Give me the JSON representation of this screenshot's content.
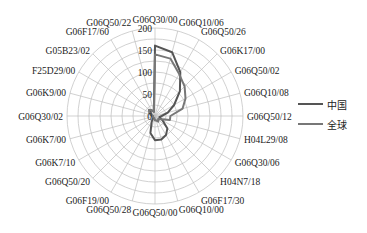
{
  "chart_data": {
    "type": "radar",
    "title": "",
    "categories": [
      "G06Q30/00",
      "G06Q10/06",
      "G06Q50/26",
      "G06K17/00",
      "G06Q50/02",
      "G06Q10/08",
      "G06Q50/12",
      "H04L29/08",
      "G06Q30/06",
      "H04N7/18",
      "G06F17/30",
      "G06Q10/00",
      "G06Q50/00",
      "G06Q50/28",
      "G06F19/00",
      "G06Q50/20",
      "G06K7/10",
      "G06K7/00",
      "G06Q30/02",
      "G06K9/00",
      "F25D29/00",
      "G05B23/02",
      "G06F17/60",
      "G06Q50/22"
    ],
    "radial_ticks": [
      0,
      50,
      100,
      150,
      200
    ],
    "radial_tick_labels": [
      "0",
      "50",
      "100",
      "150",
      "200"
    ],
    "rlim": [
      0,
      200
    ],
    "grid": true,
    "legend_position": "right",
    "series": [
      {
        "name": "中国",
        "color": "#555555",
        "values": [
          160,
          150,
          115,
          80,
          50,
          30,
          15,
          10,
          20,
          40,
          50,
          55,
          55,
          40,
          15,
          5,
          5,
          5,
          5,
          8,
          10,
          15,
          15,
          10
        ]
      },
      {
        "name": "全球",
        "color": "#777777",
        "values": [
          140,
          135,
          110,
          95,
          80,
          65,
          35,
          35,
          15,
          10,
          15,
          10,
          10,
          5,
          5,
          5,
          5,
          5,
          5,
          10,
          15,
          20,
          15,
          10
        ]
      }
    ]
  },
  "legend": {
    "items": [
      {
        "label": "中国",
        "color": "#555555"
      },
      {
        "label": "全球",
        "color": "#777777"
      }
    ]
  }
}
